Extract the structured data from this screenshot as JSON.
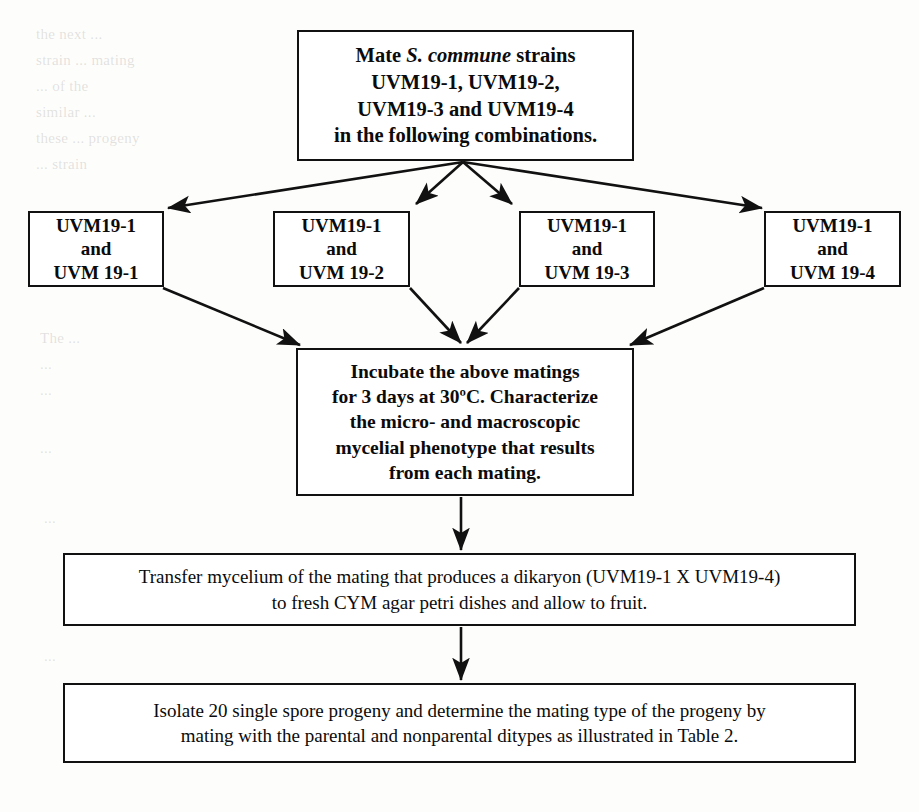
{
  "page": {
    "width": 919,
    "height": 812,
    "background_color": "#fdfdfb",
    "ink_color": "#111111"
  },
  "nodes": {
    "mate": {
      "id": "mate-strains",
      "line1_pre": "Mate ",
      "line1_species": "S. commune",
      "line1_post": " strains",
      "line2": "UVM19-1, UVM19-2,",
      "line3": "UVM19-3 and UVM19-4",
      "line4": "in the following combinations."
    },
    "combos": [
      {
        "id": "combo-1",
        "line1": "UVM19-1",
        "line2": "and",
        "line3": "UVM 19-1"
      },
      {
        "id": "combo-2",
        "line1": "UVM19-1",
        "line2": "and",
        "line3": "UVM 19-2"
      },
      {
        "id": "combo-3",
        "line1": "UVM19-1",
        "line2": "and",
        "line3": "UVM 19-3"
      },
      {
        "id": "combo-4",
        "line1": "UVM19-1",
        "line2": "and",
        "line3": "UVM 19-4"
      }
    ],
    "incubate": {
      "id": "incubate-matings",
      "line1": "Incubate the above matings",
      "line2": "for 3 days at 30ºC.  Characterize",
      "line3": "the micro- and macroscopic",
      "line4": "mycelial phenotype that results",
      "line5": "from each mating."
    },
    "transfer": {
      "id": "transfer-mycelium",
      "line1": "Transfer mycelium of the mating that produces a dikaryon (UVM19-1 X UVM19-4)",
      "line2": "to fresh CYM agar petri dishes and allow to fruit."
    },
    "isolate": {
      "id": "isolate-progeny",
      "line1": "Isolate 20 single spore progeny and determine the mating type of the progeny by",
      "line2": "mating with the parental and nonparental ditypes as illustrated in Table 2."
    }
  },
  "connectors": [
    {
      "id": "mate-to-combo-1",
      "kind": "fan-out-arrow",
      "from": "mate",
      "to": "combo-1"
    },
    {
      "id": "mate-to-combo-2",
      "kind": "fan-out-arrow",
      "from": "mate",
      "to": "combo-2"
    },
    {
      "id": "mate-to-combo-3",
      "kind": "fan-out-arrow",
      "from": "mate",
      "to": "combo-3"
    },
    {
      "id": "mate-to-combo-4",
      "kind": "fan-out-arrow",
      "from": "mate",
      "to": "combo-4"
    },
    {
      "id": "combo-1-to-incubate",
      "kind": "fan-in-arrow",
      "from": "combo-1",
      "to": "incubate"
    },
    {
      "id": "combo-2-to-incubate",
      "kind": "fan-in-arrow",
      "from": "combo-2",
      "to": "incubate"
    },
    {
      "id": "combo-3-to-incubate",
      "kind": "fan-in-arrow",
      "from": "combo-3",
      "to": "incubate"
    },
    {
      "id": "combo-4-to-incubate",
      "kind": "fan-in-arrow",
      "from": "combo-4",
      "to": "incubate"
    },
    {
      "id": "incubate-to-transfer",
      "kind": "vertical-arrow",
      "from": "incubate",
      "to": "transfer"
    },
    {
      "id": "transfer-to-isolate",
      "kind": "vertical-arrow",
      "from": "transfer",
      "to": "isolate"
    }
  ],
  "ghost_text": [
    {
      "text": "the next ...",
      "x": 36,
      "y": 26
    },
    {
      "text": "strain ... mating",
      "x": 36,
      "y": 52
    },
    {
      "text": "... of the",
      "x": 36,
      "y": 78
    },
    {
      "text": "similar ...",
      "x": 36,
      "y": 104
    },
    {
      "text": "these ... progeny",
      "x": 36,
      "y": 130
    },
    {
      "text": "... strain",
      "x": 36,
      "y": 156
    },
    {
      "text": "...",
      "x": 44,
      "y": 250
    },
    {
      "text": "The ...",
      "x": 40,
      "y": 330
    },
    {
      "text": "...",
      "x": 40,
      "y": 356
    },
    {
      "text": "...",
      "x": 40,
      "y": 382
    },
    {
      "text": "...",
      "x": 40,
      "y": 440
    },
    {
      "text": "...",
      "x": 44,
      "y": 510
    },
    {
      "text": "...",
      "x": 44,
      "y": 648
    }
  ]
}
